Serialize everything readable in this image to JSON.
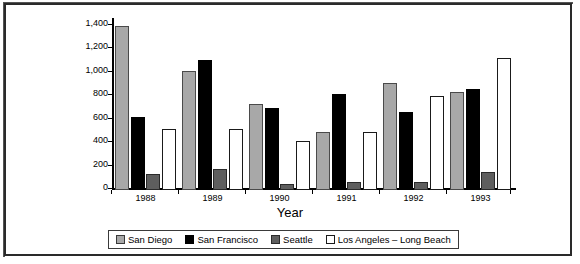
{
  "chart_data": {
    "type": "bar",
    "title": "",
    "xlabel": "Year",
    "ylabel": "",
    "categories": [
      "1988",
      "1989",
      "1990",
      "1991",
      "1992",
      "1993"
    ],
    "series": [
      {
        "name": "San Diego",
        "color": "#a8a8a8",
        "values": [
          1400,
          1010,
          730,
          490,
          910,
          830
        ]
      },
      {
        "name": "San Francisco",
        "color": "#000000",
        "values": [
          620,
          1110,
          700,
          820,
          660,
          860
        ]
      },
      {
        "name": "Seattle",
        "color": "#5e5e5e",
        "values": [
          140,
          180,
          50,
          70,
          70,
          150
        ]
      },
      {
        "name": "Los Angeles – Long Beach",
        "color": "#ffffff",
        "values": [
          520,
          520,
          420,
          490,
          800,
          1120
        ]
      }
    ],
    "ylim": [
      0,
      1400
    ],
    "yticks": [
      0,
      200,
      400,
      600,
      800,
      1000,
      1200,
      1400
    ],
    "ytick_labels": [
      "0",
      "200",
      "400",
      "600",
      "800",
      "1,000",
      "1,200",
      "1,400"
    ],
    "grid": false,
    "legend_position": "bottom"
  },
  "legend": {
    "items": [
      {
        "label": "San Diego",
        "swatch": "swatch-san-diego"
      },
      {
        "label": "San Francisco",
        "swatch": "swatch-san-francisco"
      },
      {
        "label": "Seattle",
        "swatch": "swatch-seattle"
      },
      {
        "label": "Los Angeles – Long Beach",
        "swatch": "swatch-los-angeles-long-beach"
      }
    ]
  },
  "axes": {
    "x_title": "Year"
  }
}
